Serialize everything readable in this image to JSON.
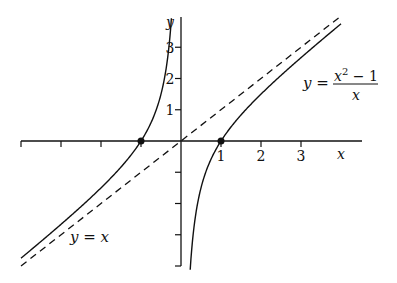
{
  "chart_data": {
    "type": "line",
    "title": "",
    "xlabel": "x",
    "ylabel": "y",
    "xlim": [
      -4,
      4
    ],
    "ylim": [
      -4,
      4
    ],
    "grid": false,
    "x_tick_labels": [
      "1",
      "2",
      "3"
    ],
    "x_ticks": [
      -4,
      -3,
      -2,
      -1,
      1,
      2,
      3
    ],
    "y_tick_labels": [
      "1",
      "2",
      "3"
    ],
    "y_ticks": [
      -4,
      -3,
      -2,
      -1,
      1,
      2,
      3
    ],
    "series": [
      {
        "name": "y = (x^2 - 1)/x",
        "style": "solid",
        "function": "x - 1/x",
        "branches": [
          {
            "x_range": [
              -4.0,
              -0.24
            ]
          },
          {
            "x_range": [
              0.23,
              4.0
            ]
          }
        ],
        "sample_points": [
          {
            "x": -4,
            "y": -3.75
          },
          {
            "x": -2,
            "y": -1.5
          },
          {
            "x": -1,
            "y": 0
          },
          {
            "x": -0.5,
            "y": 1.5
          },
          {
            "x": -0.25,
            "y": 3.75
          },
          {
            "x": 0.25,
            "y": -3.75
          },
          {
            "x": 0.5,
            "y": -1.5
          },
          {
            "x": 1,
            "y": 0
          },
          {
            "x": 2,
            "y": 1.5
          },
          {
            "x": 3,
            "y": 2.67
          },
          {
            "x": 4,
            "y": 3.75
          }
        ]
      },
      {
        "name": "y = x",
        "style": "dashed",
        "function": "x",
        "x_range": [
          -4.0,
          4.0
        ]
      }
    ],
    "marked_points": [
      {
        "x": -1,
        "y": 0
      },
      {
        "x": 1,
        "y": 0
      }
    ],
    "annotations": [
      {
        "text": "y = (x^2 - 1)/x",
        "near": "upper right"
      },
      {
        "text": "y = x",
        "near": "lower left"
      }
    ]
  },
  "labels": {
    "x_axis": "x",
    "y_axis": "y",
    "x_ticks": [
      "1",
      "2",
      "3"
    ],
    "y_ticks": [
      "1",
      "2",
      "3"
    ],
    "curve_lhs": "y =",
    "curve_num": "x",
    "curve_sup": "2",
    "curve_num_rest": " − 1",
    "curve_den": "x",
    "line_label": "y = x"
  },
  "colors": {
    "ink": "#111111",
    "background": "#ffffff"
  }
}
